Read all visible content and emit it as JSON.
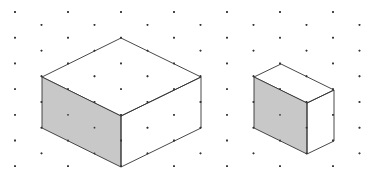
{
  "diagram": {
    "title": "",
    "type": "isometric-dot-grid",
    "grid": {
      "x0": 15,
      "dx": 26.5,
      "y0": 12,
      "dy": 12.85,
      "rows": 13,
      "cols": 14,
      "dot_color": "#333333",
      "dot_radius": 0.9
    },
    "shapes": [
      {
        "name": "large-cuboid",
        "dims_units": {
          "length": 3,
          "width": 3,
          "height": 2
        },
        "vertices": {
          "top_back": [
            121,
            38
          ],
          "top_left": [
            42,
            77
          ],
          "top_right": [
            201,
            77
          ],
          "top_front": [
            121,
            116
          ],
          "bottom_left": [
            42,
            128
          ],
          "bottom_front": [
            121,
            167
          ],
          "bottom_right": [
            201,
            128
          ]
        },
        "shaded_face": "left",
        "shade_color": "#c8c8c8"
      },
      {
        "name": "small-cuboid",
        "dims_units": {
          "length": 2,
          "width": 1,
          "height": 2
        },
        "vertices": {
          "top_back": [
            281,
            64
          ],
          "top_left": [
            254,
            77
          ],
          "top_right": [
            334,
            90
          ],
          "top_front": [
            307,
            103
          ],
          "bottom_left": [
            254,
            128
          ],
          "bottom_front": [
            307,
            154
          ],
          "bottom_right": [
            334,
            141
          ]
        },
        "shaded_face": "left",
        "shade_color": "#c8c8c8"
      }
    ],
    "line_color": "#333333"
  }
}
